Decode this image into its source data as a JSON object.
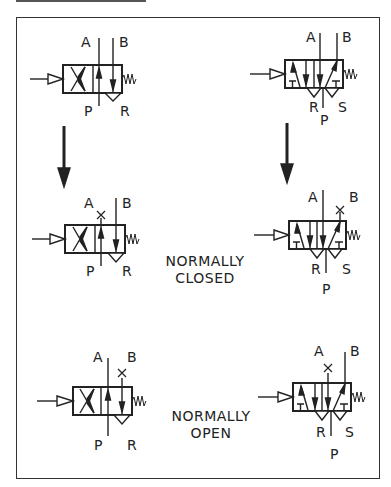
{
  "figure": {
    "title": "",
    "captions": {
      "normally_closed": {
        "line1": "NORMALLY",
        "line2": "CLOSED"
      },
      "normally_open": {
        "line1": "NORMALLY",
        "line2": "OPEN"
      }
    },
    "valves": [
      {
        "id": "valve-3-2-initial",
        "type": "3/2 pilot-operated, spring return",
        "ports": {
          "a": "A",
          "b": "B",
          "p": "P",
          "r": "R"
        }
      },
      {
        "id": "valve-5-2-initial",
        "type": "5/2 pilot-operated, spring return",
        "ports": {
          "a": "A",
          "b": "B",
          "p": "P",
          "r": "R",
          "s": "S"
        }
      },
      {
        "id": "valve-3-2-normally-closed",
        "type": "3/2 normally closed (port A blocked)",
        "ports": {
          "a": "A",
          "b": "B",
          "p": "P",
          "r": "R"
        }
      },
      {
        "id": "valve-5-2-normally-closed",
        "type": "5/2 normally closed (port B blocked)",
        "ports": {
          "a": "A",
          "b": "B",
          "p": "P",
          "r": "R",
          "s": "S"
        }
      },
      {
        "id": "valve-3-2-normally-open",
        "type": "3/2 normally open (port B blocked)",
        "ports": {
          "a": "A",
          "b": "B",
          "p": "P",
          "r": "R"
        }
      },
      {
        "id": "valve-5-2-normally-open",
        "type": "5/2 normally open (port A blocked)",
        "ports": {
          "a": "A",
          "b": "B",
          "p": "P",
          "r": "R",
          "s": "S"
        }
      }
    ],
    "transition_arrows": [
      "down-arrow-left",
      "down-arrow-right"
    ],
    "colors": {
      "ink": "#222222",
      "frame": "#333333",
      "background": "#ffffff"
    }
  }
}
